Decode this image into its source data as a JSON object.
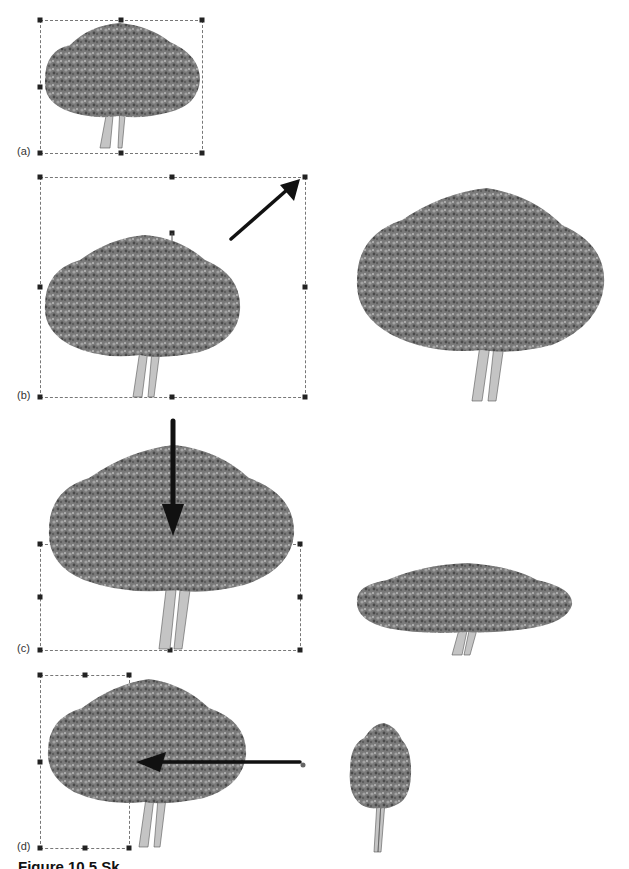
{
  "figure": {
    "caption": "Figure 10.5 Sk",
    "colors": {
      "foliage_dark": "#3a3a3a",
      "foliage_mid": "#6e6e6e",
      "foliage_light": "#9a9a9a",
      "trunk": "#bdbdbd",
      "arrow": "#111111",
      "frame": "#777777"
    }
  },
  "panels": [
    {
      "id": "a",
      "label": "(a)",
      "description": "Original tree image selected with bounding box and 8 resize handles"
    },
    {
      "id": "b",
      "label": "(b)",
      "description": "Corner handle dragged up-right to scale proportionally; result shown at right",
      "arrow_direction": "up-right"
    },
    {
      "id": "c",
      "label": "(c)",
      "description": "Top handle dragged down to squash height; flattened tree shown at right",
      "arrow_direction": "down"
    },
    {
      "id": "d",
      "label": "(d)",
      "description": "Right handle dragged left to narrow width; slim tree shown at right",
      "arrow_direction": "left"
    }
  ]
}
